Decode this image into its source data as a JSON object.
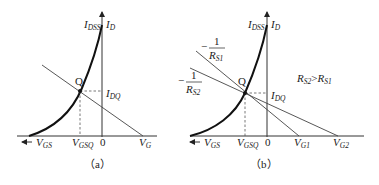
{
  "figure": {
    "panels": [
      {
        "id": "a",
        "caption": "（a）",
        "y_axis_label": "I",
        "y_axis_sub": "D",
        "idss_label": "I",
        "idss_sub": "DSS",
        "q_label": "Q",
        "idq_label": "I",
        "idq_sub": "DQ",
        "x_axis_label": "V",
        "x_axis_sub": "GS",
        "vgsq_label": "V",
        "vgsq_sub": "GSQ",
        "origin_label": "0",
        "vg_label": "V",
        "vg_sub": "G"
      },
      {
        "id": "b",
        "caption": "（b）",
        "y_axis_label": "I",
        "y_axis_sub": "D",
        "idss_label": "I",
        "idss_sub": "DSS",
        "q_label": "Q",
        "idq_label": "I",
        "idq_sub": "DQ",
        "x_axis_label": "V",
        "x_axis_sub": "GS",
        "vgsq_label": "V",
        "vgsq_sub": "GSQ",
        "origin_label": "0",
        "vg1_label": "V",
        "vg1_sub": "G1",
        "vg2_label": "V",
        "vg2_sub": "G2",
        "slope1_num": "1",
        "slope1_sign": "−",
        "slope1_den": "R",
        "slope1_den_sub": "S1",
        "slope2_num": "1",
        "slope2_sign": "−",
        "slope2_den": "R",
        "slope2_den_sub": "S2",
        "relation": {
          "a": "R",
          "a_sub": "S2",
          "op": ">",
          "b": "R",
          "b_sub": "S1"
        }
      }
    ]
  }
}
